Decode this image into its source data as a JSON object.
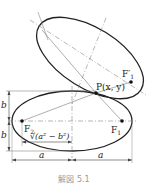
{
  "figure": {
    "caption": "解図 5.1",
    "labels": {
      "point_p": "P(x, y)",
      "focus_f1_prime": "F′",
      "focus_f1_prime_sub": "1",
      "focus_f1": "F",
      "focus_f1_sub": "1",
      "focus_f2": "F",
      "focus_f2_sub": "2",
      "semi_minor_top": "b",
      "semi_minor_bottom": "b",
      "focal_distance": "√(a² − b²)",
      "semi_major_left": "a",
      "semi_major_right": "a"
    },
    "colors": {
      "curve": "#222222",
      "guide": "#888888",
      "caption": "#999999"
    }
  }
}
